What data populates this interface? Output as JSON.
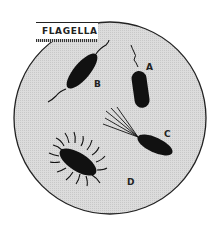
{
  "title": "FLAGELLA",
  "specimens": [
    {
      "id": "A",
      "label": "A",
      "type": "monotrichous"
    },
    {
      "id": "B",
      "label": "B",
      "type": "amphitrichous"
    },
    {
      "id": "C",
      "label": "C",
      "type": "lophotrichous"
    },
    {
      "id": "D",
      "label": "D",
      "type": "peritrichous"
    }
  ],
  "colors": {
    "field": "#d6d6d6",
    "outline": "#222222",
    "cell": "#111111"
  }
}
